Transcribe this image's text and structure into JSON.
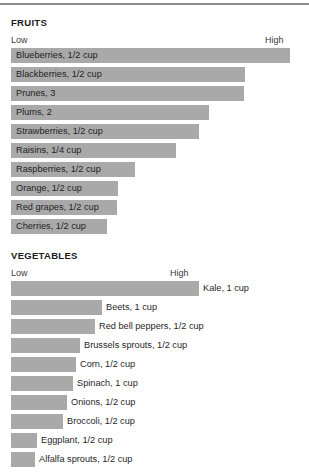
{
  "page": {
    "background_color": "#ffffff",
    "bar_color": "#a9a9a9",
    "text_color": "#231f20",
    "rule_color": "#8e8e8e"
  },
  "chart_data": [
    {
      "type": "bar",
      "title": "FRUITS",
      "orientation": "horizontal",
      "xlabel": "",
      "ylabel": "",
      "axis_low_label": "Low",
      "axis_high_label": "High",
      "label_position": "inside",
      "xlim": [
        0,
        100
      ],
      "grid": false,
      "legend": "none",
      "categories": [
        "Blueberries, 1/2 cup",
        "Blackberries, 1/2 cup",
        "Prunes, 3",
        "Plums, 2",
        "Strawberries, 1/2 cup",
        "Raisins, 1/4 cup",
        "Raspberries, 1/2 cup",
        "Orange, 1/2 cup",
        "Red grapes, 1/2 cup",
        "Cherries, 1/2 cup"
      ],
      "values": [
        100,
        84,
        83,
        71,
        67,
        59,
        44,
        38,
        38,
        34
      ],
      "bar_pixel_widths": [
        279,
        234,
        233,
        198,
        188,
        165,
        124,
        107,
        106,
        96
      ]
    },
    {
      "type": "bar",
      "title": "VEGETABLES",
      "orientation": "horizontal",
      "xlabel": "",
      "ylabel": "",
      "axis_low_label": "Low",
      "axis_high_label": "High",
      "label_position": "outside",
      "xlim": [
        0,
        100
      ],
      "grid": false,
      "legend": "none",
      "categories": [
        "Kale, 1 cup",
        "Beets, 1 cup",
        "Red bell peppers, 1/2 cup",
        "Brussels sprouts, 1/2 cup",
        "Corn, 1/2 cup",
        "Spinach, 1 cup",
        "Onions, 1/2 cup",
        "Broccoli, 1/2 cup",
        "Eggplant, 1/2 cup",
        "Alfalfa sprouts, 1/2 cup"
      ],
      "values": [
        100,
        48,
        44,
        37,
        34,
        33,
        30,
        28,
        14,
        13
      ],
      "bar_pixel_widths": [
        188,
        91,
        84,
        69,
        65,
        62,
        56,
        52,
        26,
        24
      ]
    }
  ]
}
